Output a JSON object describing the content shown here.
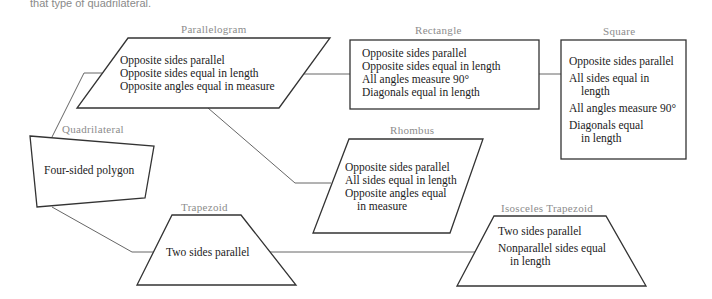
{
  "caption": "that type of quadrilateral.",
  "colors": {
    "outline": "#333333",
    "connector": "#666666",
    "label": "#8c8c8c",
    "text": "#222222"
  },
  "nodes": {
    "quadrilateral": {
      "label": "Quadrilateral",
      "lines": [
        "Four-sided polygon"
      ]
    },
    "parallelogram": {
      "label": "Parallelogram",
      "lines": [
        "Opposite sides parallel",
        "Opposite sides equal in length",
        "Opposite angles equal in measure"
      ]
    },
    "rectangle": {
      "label": "Rectangle",
      "lines": [
        "Opposite sides parallel",
        "Opposite sides equal in length",
        "All angles measure 90°",
        "Diagonals equal in length"
      ]
    },
    "square": {
      "label": "Square",
      "lines": [
        "Opposite sides parallel",
        "All sides equal in",
        "length",
        "All angles measure 90°",
        "Diagonals equal",
        "in length"
      ]
    },
    "rhombus": {
      "label": "Rhombus",
      "lines": [
        "Opposite sides parallel",
        "All sides equal in length",
        "Opposite angles equal",
        "in measure"
      ]
    },
    "trapezoid": {
      "label": "Trapezoid",
      "lines": [
        "Two sides parallel"
      ]
    },
    "isosceles_trapezoid": {
      "label": "Isosceles Trapezoid",
      "lines": [
        "Two sides parallel",
        "Nonparallel sides equal",
        "in length"
      ]
    }
  },
  "edges": [
    {
      "from": "quadrilateral",
      "to": "parallelogram"
    },
    {
      "from": "quadrilateral",
      "to": "trapezoid"
    },
    {
      "from": "parallelogram",
      "to": "rectangle"
    },
    {
      "from": "parallelogram",
      "to": "rhombus"
    },
    {
      "from": "rectangle",
      "to": "square"
    },
    {
      "from": "trapezoid",
      "to": "isosceles_trapezoid"
    }
  ]
}
